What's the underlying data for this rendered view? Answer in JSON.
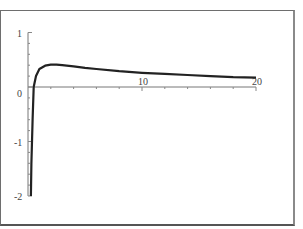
{
  "chart_data": {
    "type": "line",
    "title": "",
    "xlabel": "",
    "ylabel": "",
    "xlim": [
      0,
      20
    ],
    "ylim": [
      -2,
      1
    ],
    "grid": false,
    "legend": null,
    "x_ticks": [
      10,
      20
    ],
    "x_tick_labels": [
      "10",
      "20"
    ],
    "y_ticks": [
      1,
      0,
      -1,
      -2
    ],
    "y_tick_labels": [
      "1",
      "0",
      "-1",
      "-2"
    ],
    "series": [
      {
        "name": "f(x)",
        "color": "#222222",
        "x": [
          0.25,
          0.3,
          0.4,
          0.5,
          0.7,
          1.0,
          1.5,
          2.0,
          2.5,
          3,
          4,
          5,
          6,
          8,
          10,
          12,
          14,
          16,
          18,
          20
        ],
        "y": [
          -2.0,
          -1.4,
          -0.6,
          0.0,
          0.2,
          0.33,
          0.39,
          0.41,
          0.41,
          0.4,
          0.38,
          0.35,
          0.33,
          0.29,
          0.26,
          0.24,
          0.22,
          0.2,
          0.18,
          0.17
        ]
      }
    ]
  }
}
